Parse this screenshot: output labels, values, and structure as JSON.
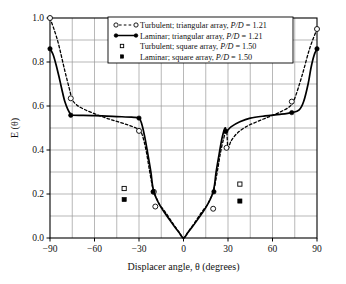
{
  "chart_data": {
    "type": "line",
    "title": "",
    "xlabel": "Displacer angle, θ (degrees)",
    "ylabel": "E (θ)",
    "xlim": [
      -90,
      90
    ],
    "ylim": [
      0.0,
      1.0
    ],
    "xticks": [
      -90,
      -60,
      -30,
      0,
      30,
      60,
      90
    ],
    "xtick_labels": [
      "−90",
      "−60",
      "−30",
      "0",
      "30",
      "60",
      "90"
    ],
    "yticks": [
      0.0,
      0.2,
      0.4,
      0.6,
      0.8,
      1.0
    ],
    "ytick_labels": [
      "0.0",
      "0.2",
      "0.4",
      "0.6",
      "0.8",
      "1.0"
    ],
    "grid": true,
    "grid_x_step": 15,
    "grid_y_step": 0.1,
    "legend_position": "top-center",
    "series": [
      {
        "name": "Turbulent; triangular array, P/D = 1.21",
        "style": "dashed",
        "marker": "open-circle",
        "color": "#000000",
        "points": [
          [
            -90,
            1.0
          ],
          [
            -85,
            0.9
          ],
          [
            -80,
            0.76
          ],
          [
            -77,
            0.68
          ],
          [
            -75,
            0.63
          ],
          [
            -72,
            0.605
          ],
          [
            -67,
            0.585
          ],
          [
            -60,
            0.565
          ],
          [
            -52,
            0.545
          ],
          [
            -45,
            0.53
          ],
          [
            -38,
            0.515
          ],
          [
            -32,
            0.5
          ],
          [
            -29,
            0.487
          ],
          [
            -27,
            0.45
          ],
          [
            -25,
            0.39
          ],
          [
            -23,
            0.31
          ],
          [
            -21,
            0.235
          ],
          [
            -20,
            0.21
          ],
          [
            -18,
            0.178
          ],
          [
            -16,
            0.15
          ],
          [
            -14,
            0.133
          ],
          [
            -12,
            0.115
          ],
          [
            -9,
            0.085
          ],
          [
            -6,
            0.055
          ],
          [
            -3,
            0.027
          ],
          [
            0,
            0.0
          ],
          [
            3,
            0.027
          ],
          [
            6,
            0.055
          ],
          [
            9,
            0.085
          ],
          [
            12,
            0.115
          ],
          [
            14,
            0.133
          ],
          [
            16,
            0.15
          ],
          [
            18,
            0.178
          ],
          [
            20,
            0.205
          ],
          [
            21,
            0.235
          ],
          [
            23,
            0.31
          ],
          [
            25,
            0.39
          ],
          [
            27,
            0.45
          ],
          [
            29,
            0.487
          ],
          [
            30,
            0.41
          ],
          [
            32,
            0.44
          ],
          [
            36,
            0.475
          ],
          [
            42,
            0.505
          ],
          [
            50,
            0.53
          ],
          [
            58,
            0.552
          ],
          [
            65,
            0.572
          ],
          [
            72,
            0.6
          ],
          [
            75,
            0.635
          ],
          [
            80,
            0.74
          ],
          [
            85,
            0.86
          ],
          [
            90,
            0.95
          ]
        ],
        "marker_points": [
          [
            -90,
            1.0
          ],
          [
            -76,
            0.635
          ],
          [
            -30,
            0.487
          ],
          [
            -20,
            0.21
          ],
          [
            -19,
            0.143
          ],
          [
            20,
            0.133
          ],
          [
            29,
            0.41
          ],
          [
            73,
            0.62
          ],
          [
            90,
            0.95
          ]
        ]
      },
      {
        "name": "Laminar; triangular array, P/D = 1.21",
        "style": "solid",
        "marker": "filled-circle",
        "color": "#000000",
        "points": [
          [
            -90,
            0.86
          ],
          [
            -88,
            0.835
          ],
          [
            -86,
            0.79
          ],
          [
            -84,
            0.735
          ],
          [
            -82,
            0.675
          ],
          [
            -80,
            0.62
          ],
          [
            -78,
            0.585
          ],
          [
            -76,
            0.562
          ],
          [
            -75,
            0.558
          ],
          [
            -60,
            0.556
          ],
          [
            -45,
            0.552
          ],
          [
            -35,
            0.549
          ],
          [
            -30,
            0.545
          ],
          [
            -28,
            0.515
          ],
          [
            -26,
            0.455
          ],
          [
            -24,
            0.38
          ],
          [
            -22,
            0.3
          ],
          [
            -21,
            0.245
          ],
          [
            -20,
            0.21
          ],
          [
            -18,
            0.175
          ],
          [
            -15,
            0.138
          ],
          [
            -12,
            0.108
          ],
          [
            -9,
            0.079
          ],
          [
            -6,
            0.051
          ],
          [
            -3,
            0.025
          ],
          [
            0,
            0.0
          ],
          [
            3,
            0.025
          ],
          [
            6,
            0.051
          ],
          [
            9,
            0.079
          ],
          [
            12,
            0.108
          ],
          [
            15,
            0.138
          ],
          [
            18,
            0.175
          ],
          [
            20,
            0.21
          ],
          [
            21,
            0.245
          ],
          [
            22,
            0.3
          ],
          [
            24,
            0.38
          ],
          [
            26,
            0.455
          ],
          [
            28,
            0.5
          ],
          [
            29,
            0.485
          ],
          [
            32,
            0.505
          ],
          [
            38,
            0.528
          ],
          [
            45,
            0.545
          ],
          [
            55,
            0.555
          ],
          [
            65,
            0.562
          ],
          [
            73,
            0.57
          ],
          [
            78,
            0.582
          ],
          [
            81,
            0.62
          ],
          [
            84,
            0.7
          ],
          [
            86,
            0.775
          ],
          [
            88,
            0.83
          ],
          [
            90,
            0.86
          ]
        ],
        "marker_points": [
          [
            -90,
            0.86
          ],
          [
            -76,
            0.558
          ],
          [
            -30,
            0.545
          ],
          [
            -20.5,
            0.21
          ],
          [
            20.5,
            0.21
          ],
          [
            28.5,
            0.485
          ],
          [
            73,
            0.57
          ],
          [
            90,
            0.86
          ]
        ]
      },
      {
        "name": "Turbulent; square array, P/D = 1.50",
        "style": "none",
        "marker": "open-square",
        "color": "#000000",
        "points": [
          [
            -40,
            0.225
          ],
          [
            38,
            0.245
          ]
        ]
      },
      {
        "name": "Laminar; square array, P/D = 1.50",
        "style": "none",
        "marker": "filled-square",
        "color": "#000000",
        "points": [
          [
            -40,
            0.175
          ],
          [
            38,
            0.168
          ]
        ]
      }
    ],
    "legend_entries": [
      {
        "label_plain": "Turbulent; triangular array, ",
        "label_italic": "P/D",
        "label_tail": " = 1.21",
        "marker": "open-circle",
        "line": "dashed"
      },
      {
        "label_plain": "Laminar; triangular array, ",
        "label_italic": "P/D",
        "label_tail": " = 1.21",
        "marker": "filled-circle",
        "line": "solid"
      },
      {
        "label_plain": "Turbulent; square array, ",
        "label_italic": "P/D",
        "label_tail": " = 1.50",
        "marker": "open-square",
        "line": "none"
      },
      {
        "label_plain": "Laminar; square array, ",
        "label_italic": "P/D",
        "label_tail": " = 1.50",
        "marker": "filled-square",
        "line": "none"
      }
    ],
    "colors": {
      "axis": "#000000",
      "grid": "#9a9a9a",
      "series": "#000000",
      "background": "#ffffff"
    }
  }
}
